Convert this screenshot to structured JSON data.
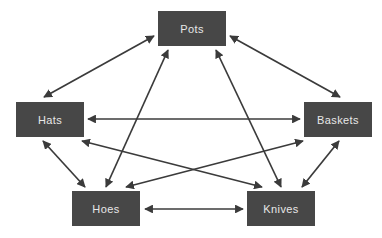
{
  "diagram": {
    "type": "undirected-graph",
    "background_color": "#ffffff",
    "node_fill_color": "#474747",
    "node_text_color": "#e8e8e8",
    "edge_color": "#3b3b3b",
    "edge_style": "double-headed-arrow",
    "nodes": [
      {
        "id": "pots",
        "label": "Pots",
        "x": 158,
        "y": 11,
        "w": 68,
        "h": 35
      },
      {
        "id": "hats",
        "label": "Hats",
        "x": 16,
        "y": 102,
        "w": 68,
        "h": 35
      },
      {
        "id": "baskets",
        "label": "Baskets",
        "x": 304,
        "y": 102,
        "w": 68,
        "h": 35
      },
      {
        "id": "hoes",
        "label": "Hoes",
        "x": 72,
        "y": 191,
        "w": 68,
        "h": 35
      },
      {
        "id": "knives",
        "label": "Knives",
        "x": 247,
        "y": 191,
        "w": 68,
        "h": 35
      }
    ],
    "edges": [
      {
        "id": "hats-pots",
        "from": "hats",
        "to": "pots",
        "x1": 44,
        "y1": 97,
        "x2": 154,
        "y2": 36
      },
      {
        "id": "pots-baskets",
        "from": "pots",
        "to": "baskets",
        "x1": 230,
        "y1": 36,
        "x2": 340,
        "y2": 97
      },
      {
        "id": "hats-baskets",
        "from": "hats",
        "to": "baskets",
        "x1": 88,
        "y1": 119,
        "x2": 300,
        "y2": 119
      },
      {
        "id": "pots-hoes",
        "from": "pots",
        "to": "hoes",
        "x1": 168,
        "y1": 50,
        "x2": 106,
        "y2": 187
      },
      {
        "id": "pots-knives",
        "from": "pots",
        "to": "knives",
        "x1": 216,
        "y1": 50,
        "x2": 281,
        "y2": 187
      },
      {
        "id": "hats-hoes",
        "from": "hats",
        "to": "hoes",
        "x1": 43,
        "y1": 141,
        "x2": 85,
        "y2": 187
      },
      {
        "id": "baskets-knives",
        "from": "baskets",
        "to": "knives",
        "x1": 339,
        "y1": 141,
        "x2": 302,
        "y2": 187
      },
      {
        "id": "hats-knives",
        "from": "hats",
        "to": "knives",
        "x1": 82,
        "y1": 141,
        "x2": 262,
        "y2": 187
      },
      {
        "id": "baskets-hoes",
        "from": "baskets",
        "to": "hoes",
        "x1": 303,
        "y1": 141,
        "x2": 126,
        "y2": 187
      },
      {
        "id": "hoes-knives",
        "from": "hoes",
        "to": "knives",
        "x1": 145,
        "y1": 209,
        "x2": 243,
        "y2": 209
      }
    ]
  }
}
